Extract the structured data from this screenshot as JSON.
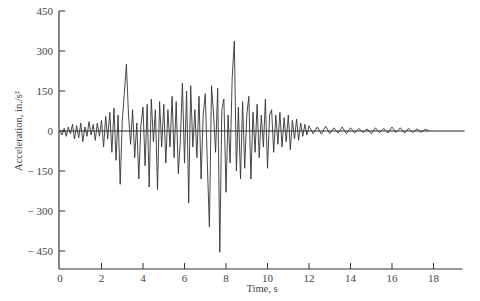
{
  "chart_data": {
    "type": "line",
    "title": "",
    "xlabel": "Time, s",
    "ylabel": "Acceleration, in./s²",
    "xlim": [
      0,
      19.5
    ],
    "ylim": [
      -450,
      450
    ],
    "x_ticks": [
      0,
      2,
      4,
      6,
      8,
      10,
      12,
      14,
      16,
      18
    ],
    "y_ticks": [
      450,
      300,
      150,
      0,
      -150,
      -300,
      -450
    ],
    "y_tick_labels": [
      "450",
      "300",
      "150",
      "0",
      "− 150",
      "− 300",
      "− 450"
    ],
    "grid": false,
    "zero_line": true,
    "series": [
      {
        "name": "ground acceleration",
        "points": [
          [
            0.0,
            0
          ],
          [
            0.1,
            -15
          ],
          [
            0.2,
            10
          ],
          [
            0.3,
            -20
          ],
          [
            0.4,
            15
          ],
          [
            0.5,
            -10
          ],
          [
            0.6,
            25
          ],
          [
            0.7,
            -30
          ],
          [
            0.8,
            20
          ],
          [
            0.9,
            -25
          ],
          [
            1.0,
            30
          ],
          [
            1.1,
            -40
          ],
          [
            1.2,
            15
          ],
          [
            1.3,
            -20
          ],
          [
            1.4,
            35
          ],
          [
            1.5,
            -15
          ],
          [
            1.6,
            25
          ],
          [
            1.7,
            -35
          ],
          [
            1.8,
            30
          ],
          [
            1.9,
            -20
          ],
          [
            2.0,
            40
          ],
          [
            2.1,
            -60
          ],
          [
            2.2,
            55
          ],
          [
            2.3,
            -30
          ],
          [
            2.4,
            70
          ],
          [
            2.5,
            -80
          ],
          [
            2.6,
            85
          ],
          [
            2.7,
            -110
          ],
          [
            2.8,
            60
          ],
          [
            2.9,
            -200
          ],
          [
            3.0,
            40
          ],
          [
            3.1,
            140
          ],
          [
            3.2,
            250
          ],
          [
            3.3,
            60
          ],
          [
            3.4,
            -50
          ],
          [
            3.5,
            80
          ],
          [
            3.6,
            -100
          ],
          [
            3.7,
            30
          ],
          [
            3.8,
            -180
          ],
          [
            3.9,
            20
          ],
          [
            4.0,
            90
          ],
          [
            4.1,
            -130
          ],
          [
            4.2,
            100
          ],
          [
            4.3,
            -210
          ],
          [
            4.4,
            120
          ],
          [
            4.5,
            -40
          ],
          [
            4.6,
            80
          ],
          [
            4.7,
            -220
          ],
          [
            4.8,
            110
          ],
          [
            4.9,
            -60
          ],
          [
            5.0,
            100
          ],
          [
            5.1,
            -120
          ],
          [
            5.2,
            80
          ],
          [
            5.3,
            -60
          ],
          [
            5.4,
            130
          ],
          [
            5.5,
            -100
          ],
          [
            5.6,
            110
          ],
          [
            5.7,
            -160
          ],
          [
            5.8,
            -40
          ],
          [
            5.9,
            180
          ],
          [
            6.0,
            -120
          ],
          [
            6.1,
            150
          ],
          [
            6.2,
            -270
          ],
          [
            6.3,
            170
          ],
          [
            6.4,
            -60
          ],
          [
            6.5,
            80
          ],
          [
            6.6,
            -100
          ],
          [
            6.7,
            130
          ],
          [
            6.8,
            -180
          ],
          [
            6.9,
            60
          ],
          [
            7.0,
            140
          ],
          [
            7.1,
            -120
          ],
          [
            7.2,
            -360
          ],
          [
            7.3,
            170
          ],
          [
            7.4,
            60
          ],
          [
            7.5,
            -80
          ],
          [
            7.6,
            160
          ],
          [
            7.7,
            -455
          ],
          [
            7.8,
            80
          ],
          [
            7.9,
            120
          ],
          [
            8.0,
            -230
          ],
          [
            8.1,
            60
          ],
          [
            8.2,
            -120
          ],
          [
            8.3,
            200
          ],
          [
            8.4,
            337
          ],
          [
            8.5,
            -150
          ],
          [
            8.6,
            90
          ],
          [
            8.7,
            -180
          ],
          [
            8.8,
            110
          ],
          [
            8.9,
            -140
          ],
          [
            9.0,
            60
          ],
          [
            9.1,
            130
          ],
          [
            9.2,
            -180
          ],
          [
            9.3,
            70
          ],
          [
            9.4,
            -80
          ],
          [
            9.5,
            100
          ],
          [
            9.6,
            -100
          ],
          [
            9.7,
            60
          ],
          [
            9.8,
            -60
          ],
          [
            9.9,
            120
          ],
          [
            10.0,
            -140
          ],
          [
            10.1,
            60
          ],
          [
            10.2,
            80
          ],
          [
            10.3,
            -80
          ],
          [
            10.4,
            60
          ],
          [
            10.5,
            -50
          ],
          [
            10.6,
            70
          ],
          [
            10.7,
            -60
          ],
          [
            10.8,
            50
          ],
          [
            10.9,
            -40
          ],
          [
            11.0,
            60
          ],
          [
            11.1,
            -70
          ],
          [
            11.2,
            40
          ],
          [
            11.3,
            -30
          ],
          [
            11.4,
            45
          ],
          [
            11.5,
            -35
          ],
          [
            11.6,
            30
          ],
          [
            11.7,
            -20
          ],
          [
            11.8,
            25
          ],
          [
            11.9,
            -15
          ],
          [
            12.0,
            20
          ],
          [
            12.2,
            -10
          ],
          [
            12.4,
            15
          ],
          [
            12.6,
            -12
          ],
          [
            12.8,
            18
          ],
          [
            13.0,
            -10
          ],
          [
            13.2,
            12
          ],
          [
            13.4,
            -8
          ],
          [
            13.6,
            15
          ],
          [
            13.8,
            -10
          ],
          [
            14.0,
            12
          ],
          [
            14.2,
            -8
          ],
          [
            14.4,
            10
          ],
          [
            14.6,
            -6
          ],
          [
            14.8,
            8
          ],
          [
            15.0,
            -10
          ],
          [
            15.2,
            12
          ],
          [
            15.4,
            -6
          ],
          [
            15.6,
            10
          ],
          [
            15.8,
            -8
          ],
          [
            16.0,
            15
          ],
          [
            16.2,
            -6
          ],
          [
            16.4,
            12
          ],
          [
            16.6,
            -8
          ],
          [
            16.8,
            10
          ],
          [
            17.0,
            -6
          ],
          [
            17.2,
            8
          ],
          [
            17.4,
            -5
          ],
          [
            17.6,
            6
          ],
          [
            17.8,
            0
          ]
        ]
      }
    ]
  },
  "labels": {
    "xlabel": "Time, s",
    "ylabel": "Acceleration, in./s²",
    "caption_partial": "(caption cut off at bottom edge)"
  }
}
